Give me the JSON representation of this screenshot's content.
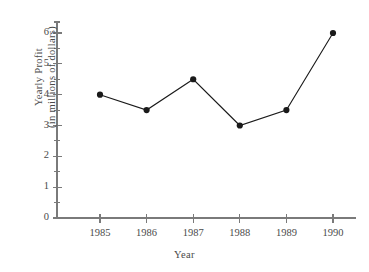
{
  "chart_data": {
    "type": "line",
    "title": "",
    "xlabel": "Year",
    "ylabel": "Yearly Profit (in millions of dollars)",
    "ylabel_line1": "Yearly Profit",
    "ylabel_line2": "(in millions of dollars)",
    "categories": [
      "1985",
      "1986",
      "1987",
      "1988",
      "1989",
      "1990"
    ],
    "x": [
      1985,
      1986,
      1987,
      1988,
      1989,
      1990
    ],
    "values": [
      4.0,
      3.5,
      4.5,
      3.0,
      3.5,
      6.0
    ],
    "ylim": [
      0,
      6
    ],
    "xlim": [
      1985,
      1990
    ],
    "y_ticks": [
      "0",
      "1",
      "2",
      "3",
      "4",
      "5",
      "6"
    ],
    "y_tick_values": [
      0,
      1,
      2,
      3,
      4,
      5,
      6
    ],
    "y_minor_tick_values": [
      0.5,
      1.5,
      2.5,
      3.5,
      4.5,
      5.5
    ],
    "x_ticks": [
      "1985",
      "1986",
      "1987",
      "1988",
      "1989",
      "1990"
    ],
    "grid": false,
    "legend": false,
    "marker": "filled-circle",
    "series_color": "#1a1a1a",
    "axis_color": "#7a7a7a",
    "text_color": "#4a4a4a",
    "background_color": "#ffffff"
  }
}
